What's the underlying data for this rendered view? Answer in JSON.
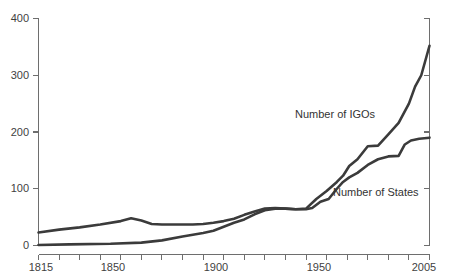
{
  "chart_data": {
    "type": "line",
    "title": "",
    "subtitle": "",
    "xlabel": "",
    "ylabel": "",
    "xlim": [
      1815,
      2005
    ],
    "ylim": [
      0,
      400
    ],
    "grid": false,
    "legend_position": "inline-annotation",
    "x_ticks_major": [
      1815,
      1850,
      1900,
      1950,
      2005
    ],
    "x_tick_labels": [
      "1815",
      "1850",
      "1900",
      "1950",
      "2005"
    ],
    "x_ticks_minor_step": 10,
    "y_ticks": [
      0,
      100,
      200,
      300,
      400
    ],
    "y_tick_labels": [
      "0",
      "100",
      "200",
      "300",
      "400"
    ],
    "axis_color": "#6e6e6e",
    "line_color": "#3b3b3b",
    "background_color": "#ffffff",
    "annotations": [
      {
        "name": "igo-series-label",
        "text": "Number of IGOs",
        "x": 1946,
        "y": 248
      },
      {
        "name": "states-series-label",
        "text": "Number of States",
        "x": 1959,
        "y": 106
      }
    ],
    "series": [
      {
        "name": "Number of IGOs",
        "label": "Number of IGOs",
        "x": [
          1815,
          1825,
          1835,
          1845,
          1855,
          1860,
          1865,
          1870,
          1875,
          1880,
          1885,
          1890,
          1895,
          1900,
          1905,
          1910,
          1915,
          1920,
          1925,
          1930,
          1935,
          1940,
          1945,
          1950,
          1955,
          1960,
          1963,
          1966,
          1970,
          1975,
          1980,
          1985,
          1990,
          1995,
          1998,
          2001,
          2005
        ],
        "values": [
          23,
          28,
          32,
          37,
          43,
          48,
          44,
          38,
          37,
          37,
          37,
          37,
          38,
          40,
          43,
          47,
          54,
          60,
          65,
          66,
          65,
          64,
          65,
          82,
          96,
          112,
          123,
          140,
          152,
          175,
          176,
          196,
          216,
          250,
          280,
          300,
          352
        ]
      },
      {
        "name": "Number of States",
        "label": "Number of States",
        "x": [
          1815,
          1830,
          1850,
          1865,
          1875,
          1885,
          1895,
          1900,
          1905,
          1910,
          1915,
          1920,
          1925,
          1930,
          1935,
          1940,
          1945,
          1948,
          1952,
          1956,
          1960,
          1963,
          1966,
          1970,
          1975,
          1980,
          1985,
          1990,
          1993,
          1996,
          2000,
          2005
        ],
        "values": [
          1,
          2,
          3,
          5,
          9,
          16,
          22,
          26,
          33,
          40,
          46,
          55,
          62,
          65,
          65,
          64,
          64,
          66,
          77,
          82,
          100,
          112,
          120,
          128,
          142,
          152,
          157,
          158,
          178,
          185,
          188,
          190
        ]
      }
    ],
    "series_detailed_igo": [
      {
        "year": 1815,
        "value": 23
      },
      {
        "year": 1860,
        "value": 48
      },
      {
        "year": 1870,
        "value": 38
      },
      {
        "year": 1900,
        "value": 40
      },
      {
        "year": 1920,
        "value": 60
      },
      {
        "year": 1930,
        "value": 66
      },
      {
        "year": 1940,
        "value": 64
      },
      {
        "year": 1950,
        "value": 82
      },
      {
        "year": 1960,
        "value": 112
      },
      {
        "year": 1966,
        "value": 140
      },
      {
        "year": 1975,
        "value": 175
      },
      {
        "year": 1985,
        "value": 196
      },
      {
        "year": 1995,
        "value": 250
      },
      {
        "year": 1999,
        "value": 350
      },
      {
        "year": 2001,
        "value": 335
      },
      {
        "year": 2005,
        "value": 352
      }
    ],
    "series_detailed_states": [
      {
        "year": 1815,
        "value": 1
      },
      {
        "year": 1900,
        "value": 26
      },
      {
        "year": 1920,
        "value": 55
      },
      {
        "year": 1940,
        "value": 64
      },
      {
        "year": 1960,
        "value": 100
      },
      {
        "year": 1975,
        "value": 142
      },
      {
        "year": 1990,
        "value": 158
      },
      {
        "year": 1993,
        "value": 178
      },
      {
        "year": 2005,
        "value": 190
      }
    ]
  },
  "axis": {
    "y_labels": [
      "400",
      "300",
      "200",
      "100",
      "0"
    ],
    "x_labels": [
      "1815",
      "1850",
      "1900",
      "1950",
      "2005"
    ]
  },
  "labels": {
    "igo": "Number of IGOs",
    "states": "Number of States"
  }
}
